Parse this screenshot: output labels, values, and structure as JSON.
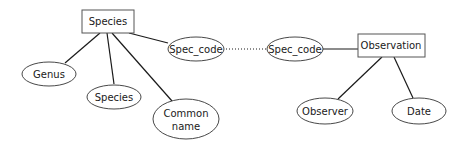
{
  "diagram": {
    "type": "entity-relationship",
    "entities": [
      {
        "id": "species",
        "label": "Species"
      },
      {
        "id": "observation",
        "label": "Observation"
      }
    ],
    "attributes": [
      {
        "id": "genus",
        "label": "Genus",
        "entity": "species"
      },
      {
        "id": "species_attr",
        "label": "Species",
        "entity": "species"
      },
      {
        "id": "common_name",
        "label_line1": "Common",
        "label_line2": "name",
        "entity": "species"
      },
      {
        "id": "spec_code_species",
        "label": "Spec_code",
        "entity": "species"
      },
      {
        "id": "spec_code_observation",
        "label": "Spec_code",
        "entity": "observation"
      },
      {
        "id": "observer",
        "label": "Observer",
        "entity": "observation"
      },
      {
        "id": "date",
        "label": "Date",
        "entity": "observation"
      }
    ],
    "links": [
      {
        "from": "spec_code_species",
        "to": "spec_code_observation",
        "style": "dotted"
      }
    ]
  }
}
